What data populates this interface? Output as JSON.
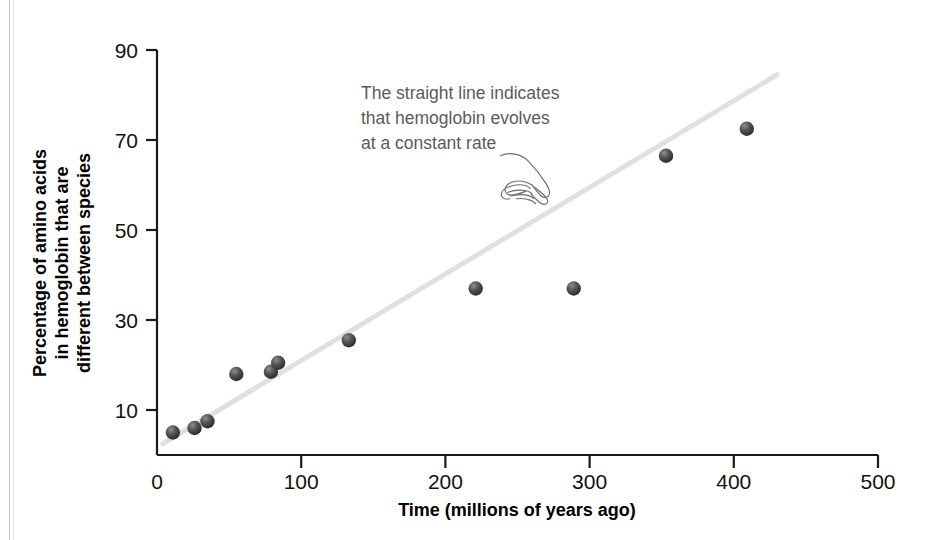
{
  "chart_data": {
    "type": "scatter",
    "title": "",
    "xlabel": "Time (millions of years ago)",
    "ylabel": "Percentage of amino acids in hemoglobin that are different between species",
    "ylabel_lines": [
      "Percentage of amino acids",
      "in hemoglobin that are",
      "different between species"
    ],
    "xlim": [
      0,
      500
    ],
    "ylim": [
      0,
      92
    ],
    "xticks": [
      0,
      100,
      200,
      300,
      400,
      500
    ],
    "yticks": [
      10,
      30,
      50,
      70,
      90
    ],
    "grid": false,
    "legend": null,
    "points": [
      {
        "x": 11,
        "y": 5
      },
      {
        "x": 26,
        "y": 6
      },
      {
        "x": 35,
        "y": 7.5
      },
      {
        "x": 55,
        "y": 18
      },
      {
        "x": 79,
        "y": 18.5
      },
      {
        "x": 84,
        "y": 20.5
      },
      {
        "x": 133,
        "y": 25.5
      },
      {
        "x": 221,
        "y": 37
      },
      {
        "x": 289,
        "y": 37
      },
      {
        "x": 353,
        "y": 66.5
      },
      {
        "x": 409,
        "y": 72.5
      }
    ],
    "trendline": {
      "x0": 4,
      "y0": 2.5,
      "x1": 430,
      "y1": 84.5,
      "color": "#e0e0e0",
      "label": "straight line"
    },
    "point_color": "#4a4a4a",
    "axis_color": "#1a1a1a",
    "annotation": {
      "lines": [
        "The straight line indicates",
        "that hemoglobin evolves",
        "at a constant rate"
      ],
      "color": "#5b5b5b",
      "pointer": "pointing-hand"
    }
  },
  "xtick_labels": [
    "0",
    "100",
    "200",
    "300",
    "400",
    "500"
  ],
  "ytick_labels": [
    "10",
    "30",
    "50",
    "70",
    "90"
  ]
}
